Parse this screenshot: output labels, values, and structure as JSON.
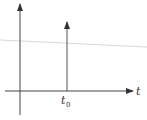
{
  "diagram": {
    "axis_label_x": "t",
    "impulse_label": "t",
    "impulse_label_sub": "0",
    "colors": {
      "axis": "#444444",
      "impulse": "#555555",
      "guide_line": "#d8d8d8"
    }
  }
}
